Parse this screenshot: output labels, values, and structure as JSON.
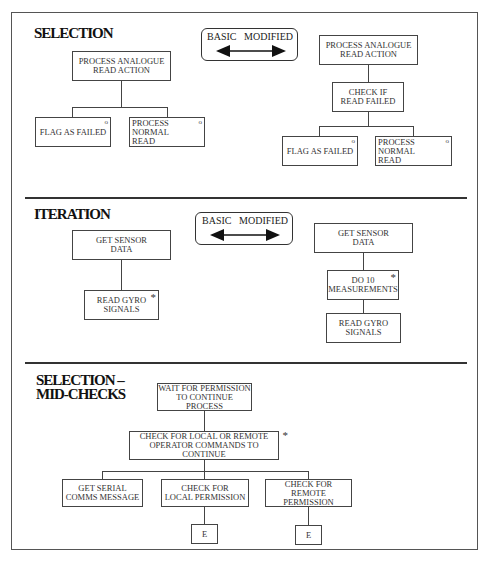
{
  "sections": {
    "selection": {
      "title": "SELECTION",
      "legend": {
        "left_label": "BASIC",
        "right_label": "MODIFIED"
      },
      "basic": {
        "root": "PROCESS ANALOGUE\nREAD ACTION",
        "children": [
          {
            "label": "FLAG AS FAILED",
            "marker": "o"
          },
          {
            "label": "PROCESS NORMAL\nREAD",
            "marker": "o"
          }
        ]
      },
      "modified": {
        "root": "PROCESS ANALOGUE\nREAD ACTION",
        "check": "CHECK IF\nREAD FAILED",
        "children": [
          {
            "label": "FLAG AS FAILED",
            "marker": "o"
          },
          {
            "label": "PROCESS NORMAL\nREAD",
            "marker": "o"
          }
        ]
      }
    },
    "iteration": {
      "title": "ITERATION",
      "legend": {
        "left_label": "BASIC",
        "right_label": "MODIFIED"
      },
      "basic": {
        "root": "GET SENSOR\nDATA",
        "child": {
          "label": "READ GYRO\nSIGNALS",
          "marker": "*"
        }
      },
      "modified": {
        "root": "GET SENSOR\nDATA",
        "loop": {
          "label": "DO 10\nMEASUREMENTS",
          "marker": "*"
        },
        "child": "READ GYRO\nSIGNALS"
      }
    },
    "midchecks": {
      "title_line1": "SELECTION –",
      "title_line2": "MID-CHECKS",
      "root": "WAIT FOR  PERMISSION\nTO CONTINUE PROCESS",
      "check": {
        "label": "CHECK FOR LOCAL OR REMOTE\nOPERATOR COMMANDS TO CONTINUE",
        "marker": "*"
      },
      "children": [
        {
          "label": "GET SERIAL\nCOMMS MESSAGE"
        },
        {
          "label": "CHECK FOR\nLOCAL PERMISSION",
          "end": "E"
        },
        {
          "label": "CHECK FOR\nREMOTE PERMISSION",
          "end": "E"
        }
      ]
    }
  }
}
